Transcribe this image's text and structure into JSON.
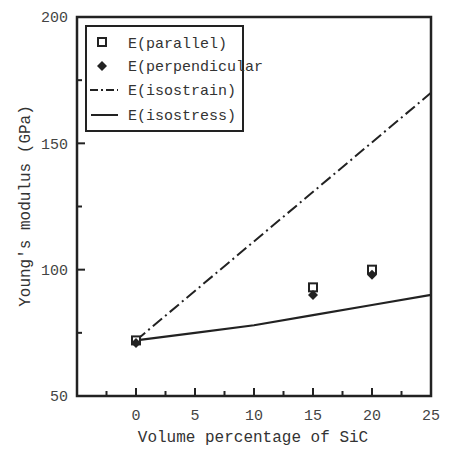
{
  "chart_data": {
    "type": "scatter",
    "title": "",
    "xlabel": "Volume percentage of SiC",
    "ylabel": "Young's modulus (GPa)",
    "xlim": [
      -5,
      25
    ],
    "ylim": [
      50,
      200
    ],
    "x_ticks": [
      0,
      5,
      10,
      15,
      20,
      25
    ],
    "x_minor_ticks": [
      -2.5,
      2.5,
      7.5,
      12.5,
      17.5,
      22.5
    ],
    "y_ticks": [
      50,
      100,
      150,
      200
    ],
    "y_minor_ticks": [
      75,
      125,
      175
    ],
    "grid": false,
    "legend_position": "upper-left",
    "series": [
      {
        "name": "E(parallel)",
        "kind": "scatter",
        "marker": "open-square",
        "x": [
          0,
          15,
          20
        ],
        "y": [
          72,
          93,
          100
        ]
      },
      {
        "name": "E(perpendicular",
        "kind": "scatter",
        "marker": "filled-diamond",
        "x": [
          0,
          15,
          20
        ],
        "y": [
          71,
          90,
          98
        ]
      },
      {
        "name": "E(isostrain)",
        "kind": "line",
        "style": "dash-dot",
        "x": [
          0,
          25
        ],
        "y": [
          72,
          170
        ]
      },
      {
        "name": "E(isostress)",
        "kind": "line",
        "style": "solid",
        "x": [
          0,
          5,
          10,
          15,
          20,
          25
        ],
        "y": [
          72,
          75,
          78,
          82,
          86,
          90
        ]
      }
    ]
  },
  "labels": {
    "x_axis": "Volume percentage of SiC",
    "y_axis": "Young's modulus (GPa)",
    "x_ticks": [
      "0",
      "5",
      "10",
      "15",
      "20",
      "25"
    ],
    "y_ticks": [
      "200",
      "150",
      "100",
      "50"
    ],
    "legend": [
      "E(parallel)",
      "E(perpendicular",
      "E(isostrain)",
      "E(isostress)"
    ]
  }
}
